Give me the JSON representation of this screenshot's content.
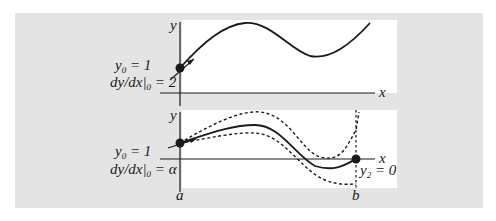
{
  "diagram": {
    "top_panel": {
      "axis_y_label": "y",
      "axis_x_label": "x",
      "initial_condition_1": {
        "var": "y",
        "sub": "0",
        "rel": " = 1"
      },
      "initial_condition_2": {
        "pre": "dy/dx",
        "sub": "0",
        "rel": " = 2"
      }
    },
    "bottom_panel": {
      "axis_y_label": "y",
      "axis_x_label": "x",
      "initial_condition_1": {
        "var": "y",
        "sub": "0",
        "rel": " = 1"
      },
      "initial_condition_2": {
        "pre": "dy/dx",
        "sub": "0",
        "rel": " = ",
        "val": "α"
      },
      "boundary_condition": {
        "var": "y",
        "sub": "2",
        "rel": " = 0"
      },
      "left_bound_label": "a",
      "right_bound_label": "b"
    },
    "colors": {
      "panel_bg": "#e4e4e4",
      "plot_bg": "#ffffff",
      "ink": "#1a1a1a"
    }
  }
}
